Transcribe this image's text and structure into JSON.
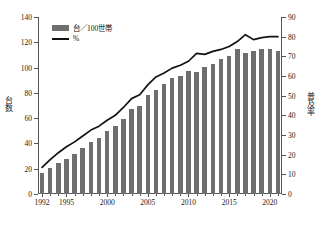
{
  "legend": {
    "bar_label": "台／100世帯",
    "line_label": "%"
  },
  "axes": {
    "left_title": "台数",
    "right_title": "普及率",
    "left_ticks": [
      "0",
      "20",
      "40",
      "60",
      "80",
      "100",
      "120",
      "140"
    ],
    "right_ticks": [
      "0",
      "10",
      "20",
      "30",
      "40",
      "50",
      "60",
      "70",
      "80",
      "90"
    ],
    "x_ticks": [
      "1992",
      "1995",
      "2000",
      "2005",
      "2010",
      "2015",
      "2020"
    ]
  },
  "footnote": "",
  "colors": {
    "bar": "#6e6e6e",
    "line": "#111111",
    "frame": "#555555",
    "text": "#1a1a1a"
  },
  "chart_data": {
    "type": "bar",
    "title": "",
    "xlabel": "",
    "ylabel": "台数",
    "y2label": "普及率",
    "ylim": [
      0,
      140
    ],
    "y2lim": [
      0,
      90
    ],
    "grid": false,
    "legend_position": "top-left",
    "categories": [
      "1992",
      "1993",
      "1994",
      "1995",
      "1996",
      "1997",
      "1998",
      "1999",
      "2000",
      "2001",
      "2002",
      "2003",
      "2004",
      "2005",
      "2006",
      "2007",
      "2008",
      "2009",
      "2010",
      "2011",
      "2012",
      "2013",
      "2014",
      "2015",
      "2016",
      "2017",
      "2018",
      "2019",
      "2020",
      "2021"
    ],
    "series": [
      {
        "name": "台／100世帯",
        "type": "bar",
        "axis": "left",
        "values": [
          16.5,
          20.5,
          24.5,
          28.0,
          31.5,
          36.5,
          41.5,
          44.5,
          50.0,
          53.5,
          59.5,
          67.5,
          70.0,
          78.5,
          82.5,
          87.0,
          92.0,
          93.5,
          97.5,
          96.5,
          100.5,
          103.0,
          106.5,
          109.5,
          115.0,
          111.5,
          113.5,
          114.5,
          114.5,
          113.5
        ]
      },
      {
        "name": "%",
        "type": "line",
        "axis": "right",
        "values": [
          13.5,
          17.5,
          21.0,
          24.0,
          26.5,
          29.5,
          32.5,
          34.5,
          37.5,
          40.0,
          44.0,
          48.5,
          50.5,
          55.5,
          59.5,
          61.5,
          64.0,
          65.5,
          67.5,
          71.5,
          71.0,
          72.5,
          73.5,
          75.0,
          77.5,
          81.0,
          78.5,
          79.5,
          80.0,
          80.0
        ]
      }
    ]
  }
}
